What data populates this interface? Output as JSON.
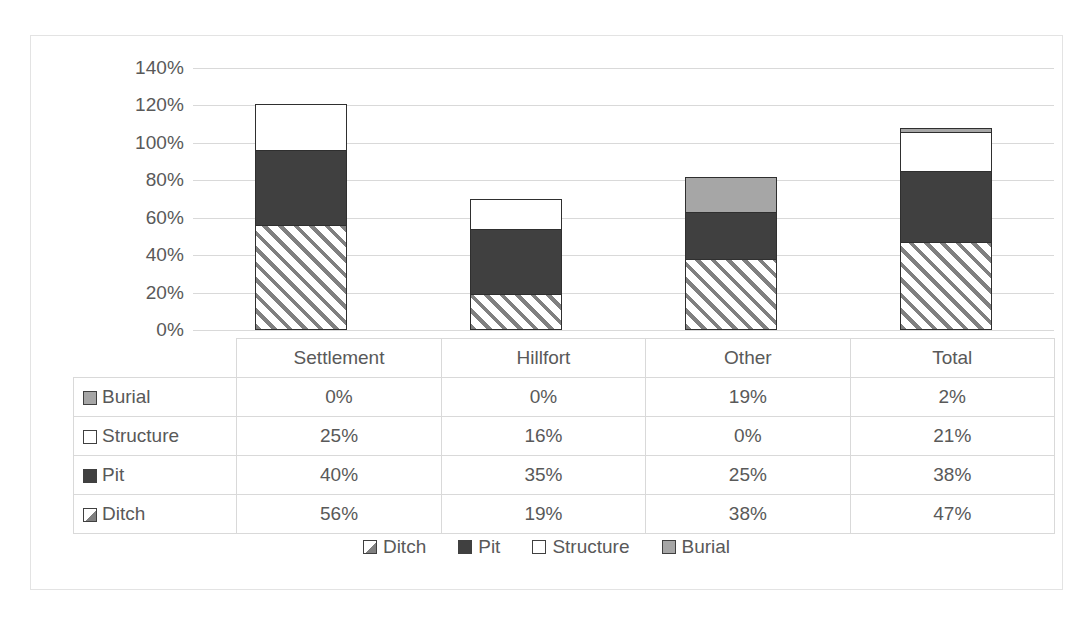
{
  "chart_data": {
    "type": "bar",
    "subtype": "stacked-column",
    "title": "",
    "xlabel": "",
    "ylabel": "",
    "ylim": [
      0,
      140
    ],
    "ytick_step": 20,
    "ytick_labels": [
      "0%",
      "20%",
      "40%",
      "60%",
      "80%",
      "100%",
      "120%",
      "140%"
    ],
    "ytick_values": [
      0,
      20,
      40,
      60,
      80,
      100,
      120,
      140
    ],
    "grid": "horizontal",
    "legend_position": "bottom",
    "categories": [
      "Settlement",
      "Hillfort",
      "Other",
      "Total"
    ],
    "stack_order_bottom_to_top": [
      "Ditch",
      "Pit",
      "Structure",
      "Burial"
    ],
    "series": [
      {
        "name": "Ditch",
        "values": [
          56,
          19,
          38,
          47
        ],
        "labels": [
          "56%",
          "19%",
          "38%",
          "47%"
        ],
        "color": "#ffffff",
        "pattern": "diagonal-hatch",
        "pattern_color": "#808080"
      },
      {
        "name": "Pit",
        "values": [
          40,
          35,
          25,
          38
        ],
        "labels": [
          "40%",
          "35%",
          "25%",
          "38%"
        ],
        "color": "#404040",
        "pattern": "solid"
      },
      {
        "name": "Structure",
        "values": [
          25,
          16,
          0,
          21
        ],
        "labels": [
          "25%",
          "16%",
          "0%",
          "21%"
        ],
        "color": "#ffffff",
        "pattern": "solid"
      },
      {
        "name": "Burial",
        "values": [
          0,
          0,
          19,
          2
        ],
        "labels": [
          "0%",
          "0%",
          "19%",
          "2%"
        ],
        "color": "#a6a6a6",
        "pattern": "solid"
      }
    ],
    "column_totals": [
      121,
      70,
      82,
      108
    ]
  },
  "table": {
    "corner_label": "",
    "column_headers": [
      "Settlement",
      "Hillfort",
      "Other",
      "Total"
    ],
    "rows": [
      {
        "label": "Burial",
        "swatch": "burial-swatch",
        "values": [
          "0%",
          "0%",
          "19%",
          "2%"
        ]
      },
      {
        "label": "Structure",
        "swatch": "structure-swatch",
        "values": [
          "25%",
          "16%",
          "0%",
          "21%"
        ]
      },
      {
        "label": "Pit",
        "swatch": "pit-swatch",
        "values": [
          "40%",
          "35%",
          "25%",
          "38%"
        ]
      },
      {
        "label": "Ditch",
        "swatch": "ditch-swatch",
        "values": [
          "56%",
          "19%",
          "38%",
          "47%"
        ]
      }
    ]
  },
  "legend": {
    "items": [
      {
        "label": "Ditch",
        "swatch": "ditch-swatch"
      },
      {
        "label": "Pit",
        "swatch": "pit-swatch"
      },
      {
        "label": "Structure",
        "swatch": "structure-swatch"
      },
      {
        "label": "Burial",
        "swatch": "burial-swatch"
      }
    ]
  },
  "colors": {
    "ditch_fill": "#ffffff",
    "ditch_hatch": "#808080",
    "pit": "#404040",
    "structure": "#ffffff",
    "burial": "#a6a6a6",
    "gridline": "#d9d9d9",
    "text": "#595959",
    "border": "#e3e3e3",
    "bar_outline": "#2f2f2f"
  }
}
